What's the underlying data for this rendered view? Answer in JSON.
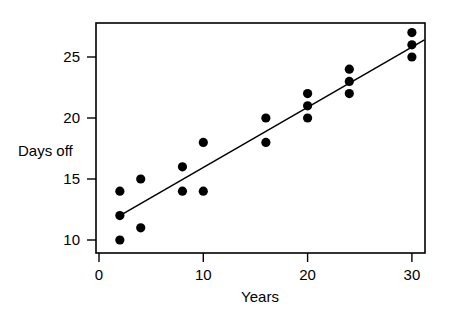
{
  "chart_data": {
    "type": "scatter",
    "title": "",
    "xlabel": "Years",
    "ylabel": "Days off",
    "xlim": [
      0,
      31.2
    ],
    "ylim": [
      9.1,
      27.6
    ],
    "grid": false,
    "legend": "none",
    "x_ticks": [
      0,
      10,
      20,
      30
    ],
    "x_tick_labels": [
      "0",
      "10",
      "20",
      "30"
    ],
    "y_ticks": [
      10,
      15,
      20,
      25
    ],
    "y_tick_labels": [
      "10",
      "15",
      "20",
      "25"
    ],
    "points": [
      {
        "x": 2,
        "y": 14
      },
      {
        "x": 2,
        "y": 12
      },
      {
        "x": 2,
        "y": 10
      },
      {
        "x": 4,
        "y": 15
      },
      {
        "x": 4,
        "y": 11
      },
      {
        "x": 8,
        "y": 16
      },
      {
        "x": 8,
        "y": 14
      },
      {
        "x": 10,
        "y": 18
      },
      {
        "x": 10,
        "y": 14
      },
      {
        "x": 16,
        "y": 20
      },
      {
        "x": 16,
        "y": 18
      },
      {
        "x": 20,
        "y": 22
      },
      {
        "x": 20,
        "y": 21
      },
      {
        "x": 20,
        "y": 20
      },
      {
        "x": 24,
        "y": 24
      },
      {
        "x": 24,
        "y": 23
      },
      {
        "x": 24,
        "y": 22
      },
      {
        "x": 30,
        "y": 27
      },
      {
        "x": 30,
        "y": 26
      },
      {
        "x": 30,
        "y": 25
      }
    ],
    "trend_line": {
      "label": "regression line",
      "x_start": 2,
      "y_start": 12,
      "x_end": 31.2,
      "y_end": 26.4,
      "slope": 0.493,
      "intercept": 11.01
    },
    "colors": {
      "point": "#000000",
      "line": "#000000",
      "axis": "#000000",
      "background": "#ffffff"
    }
  }
}
